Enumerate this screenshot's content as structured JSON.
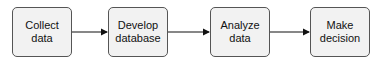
{
  "diagram": {
    "type": "flowchart",
    "direction": "left-to-right",
    "nodes": [
      {
        "id": "n1",
        "label": "Collect\ndata"
      },
      {
        "id": "n2",
        "label": "Develop\ndatabase"
      },
      {
        "id": "n3",
        "label": "Analyze\ndata"
      },
      {
        "id": "n4",
        "label": "Make\ndecision"
      }
    ],
    "edges": [
      {
        "from": "n1",
        "to": "n2"
      },
      {
        "from": "n2",
        "to": "n3"
      },
      {
        "from": "n3",
        "to": "n4"
      }
    ],
    "colors": {
      "node_fill": "#f2f2f2",
      "node_border": "#555555",
      "edge": "#111111"
    }
  }
}
